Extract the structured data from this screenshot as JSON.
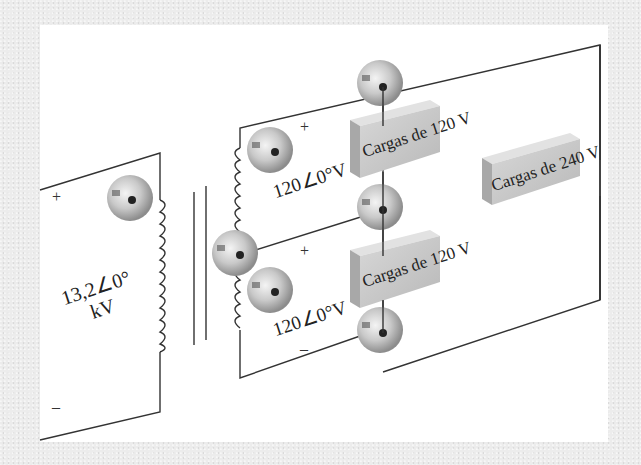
{
  "diagram": {
    "primary": {
      "voltage_line1": "13,2∠0°",
      "voltage_line2": "kV",
      "plus": "+",
      "minus": "–"
    },
    "secondary_upper": {
      "voltage": "120∠0°V",
      "plus": "+"
    },
    "secondary_lower": {
      "voltage": "120∠0°V",
      "plus": "+",
      "minus": "–"
    },
    "loads": [
      {
        "label": "Cargas de 120 V"
      },
      {
        "label": "Cargas de 120 V"
      },
      {
        "label": "Cargas de 240 V"
      }
    ],
    "colors": {
      "wire": "#333333",
      "load_box": "#c8c8c8",
      "terminal": "#bdbdbd",
      "panel": "#ffffff",
      "background": "#ececec"
    }
  }
}
